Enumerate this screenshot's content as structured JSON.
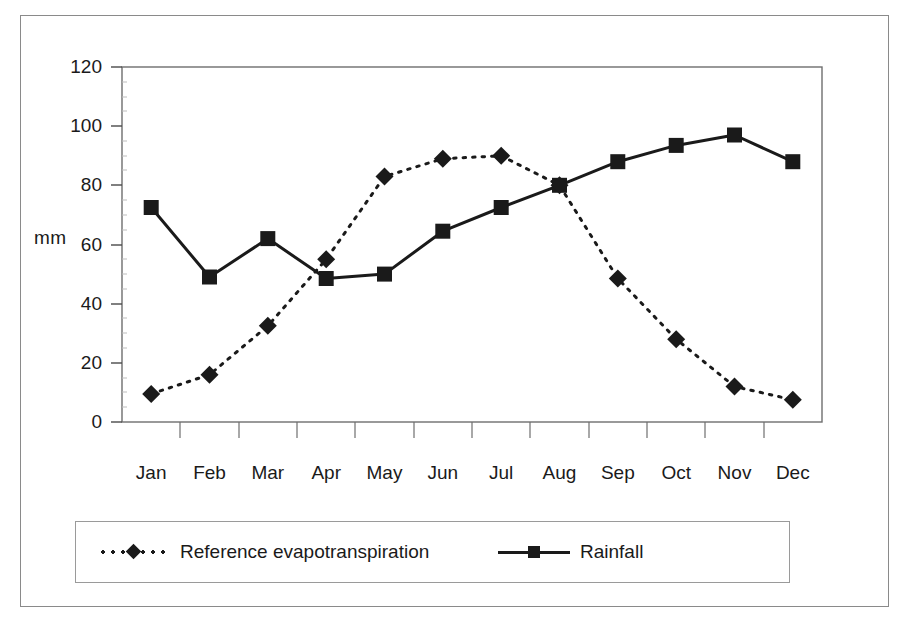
{
  "chart_data": {
    "type": "line",
    "title": "",
    "xlabel": "",
    "ylabel": "mm",
    "categories": [
      "Jan",
      "Feb",
      "Mar",
      "Apr",
      "May",
      "Jun",
      "Jul",
      "Aug",
      "Sep",
      "Oct",
      "Nov",
      "Dec"
    ],
    "ylim": [
      0,
      120
    ],
    "yticks": [
      0,
      20,
      40,
      60,
      80,
      100,
      120
    ],
    "grid": false,
    "legend_position": "bottom",
    "series": [
      {
        "name": "Reference evapotranspiration",
        "marker": "diamond",
        "linestyle": "dotted",
        "color": "#1a1a1a",
        "values": [
          9.5,
          16,
          32.5,
          55,
          83,
          89,
          90,
          80,
          48.5,
          28,
          12,
          7.5
        ]
      },
      {
        "name": "Rainfall",
        "marker": "square",
        "linestyle": "solid",
        "color": "#1a1a1a",
        "values": [
          72.5,
          49,
          62,
          48.5,
          50,
          64.5,
          72.5,
          80,
          88,
          93.5,
          97,
          88
        ]
      }
    ]
  },
  "legend": {
    "items": [
      {
        "label": "Reference evapotranspiration"
      },
      {
        "label": "Rainfall"
      }
    ]
  },
  "axis": {
    "y_label": "mm",
    "y_tick_labels": [
      "120",
      "100",
      "80",
      "60",
      "40",
      "20",
      "0"
    ],
    "x_tick_labels": [
      "Jan",
      "Feb",
      "Mar",
      "Apr",
      "May",
      "Jun",
      "Jul",
      "Aug",
      "Sep",
      "Oct",
      "Nov",
      "Dec"
    ]
  },
  "colors": {
    "ink": "#1a1a1a",
    "frame": "#8a8a8a",
    "background": "#ffffff"
  }
}
